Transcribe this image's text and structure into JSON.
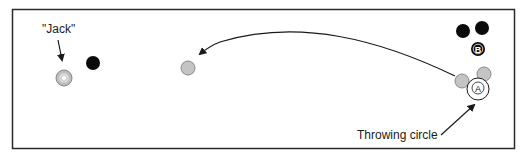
{
  "diagram": {
    "labels": {
      "jack": "\"Jack\"",
      "throwing_circle": "Throwing circle",
      "player_a": "A",
      "player_b": "B"
    },
    "colors": {
      "border": "#2a2a2a",
      "gray_ball": "#c4c4c4",
      "gray_ball_stroke": "#8a8a8a",
      "black_ball": "#0a0a0a",
      "jack_fill": "#bdbdbd",
      "jack_center": "#ffffff",
      "arrow": "#1a1a1a"
    },
    "balls": [
      {
        "id": "jack",
        "cx": 64,
        "cy": 78,
        "r": 8,
        "color": "jack"
      },
      {
        "id": "black-near-jack",
        "cx": 93,
        "cy": 63,
        "r": 7,
        "color": "black"
      },
      {
        "id": "gray-thrown",
        "cx": 188,
        "cy": 68,
        "r": 7,
        "color": "gray"
      },
      {
        "id": "gray-right-1",
        "cx": 462,
        "cy": 81,
        "r": 7,
        "color": "gray"
      },
      {
        "id": "gray-right-2",
        "cx": 484,
        "cy": 74,
        "r": 7,
        "color": "gray"
      },
      {
        "id": "black-right-1",
        "cx": 463,
        "cy": 31,
        "r": 7,
        "color": "black"
      },
      {
        "id": "black-right-2",
        "cx": 482,
        "cy": 28,
        "r": 7,
        "color": "black"
      },
      {
        "id": "player-b",
        "cx": 478,
        "cy": 49,
        "r": 7,
        "color": "black"
      }
    ]
  }
}
